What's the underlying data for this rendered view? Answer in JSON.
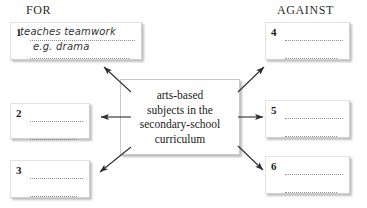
{
  "headings": {
    "left": "FOR",
    "right": "AGAINST"
  },
  "topic": {
    "text": "arts-based subjects in the secondary-school curriculum",
    "lines": [
      "arts-based",
      "subjects in the",
      "secondary-school",
      "curriculum"
    ]
  },
  "boxes": [
    {
      "number": "1",
      "side": "for",
      "filled": true,
      "handwriting": [
        "teaches teamwork",
        "e.g. drama"
      ],
      "trailing_dots_line1": "",
      "trailing_dots_line2": "......."
    },
    {
      "number": "2",
      "side": "for",
      "filled": false,
      "handwriting": [
        "",
        ""
      ]
    },
    {
      "number": "3",
      "side": "for",
      "filled": false,
      "handwriting": [
        "",
        ""
      ]
    },
    {
      "number": "4",
      "side": "against",
      "filled": false,
      "handwriting": [
        "",
        ""
      ]
    },
    {
      "number": "5",
      "side": "against",
      "filled": false,
      "handwriting": [
        "",
        ""
      ]
    },
    {
      "number": "6",
      "side": "against",
      "filled": false,
      "handwriting": [
        "",
        ""
      ]
    }
  ],
  "arrows": [
    {
      "name": "arrow-to-box-1",
      "direction": "up-left",
      "from": "topic",
      "to": "1"
    },
    {
      "name": "arrow-to-box-2",
      "direction": "left",
      "from": "topic",
      "to": "2"
    },
    {
      "name": "arrow-to-box-3",
      "direction": "down-left",
      "from": "topic",
      "to": "3"
    },
    {
      "name": "arrow-to-box-4",
      "direction": "up-right",
      "from": "topic",
      "to": "4"
    },
    {
      "name": "arrow-to-box-5",
      "direction": "right",
      "from": "topic",
      "to": "5"
    },
    {
      "name": "arrow-to-box-6",
      "direction": "down-right",
      "from": "topic",
      "to": "6"
    }
  ],
  "colors": {
    "ink": "#1a1a1a",
    "handwriting": "#333333",
    "dotted_rule": "#8e8e8e",
    "box_border": "#cfcfcf",
    "arrow": "#2e2e2e",
    "background": "#ffffff"
  }
}
